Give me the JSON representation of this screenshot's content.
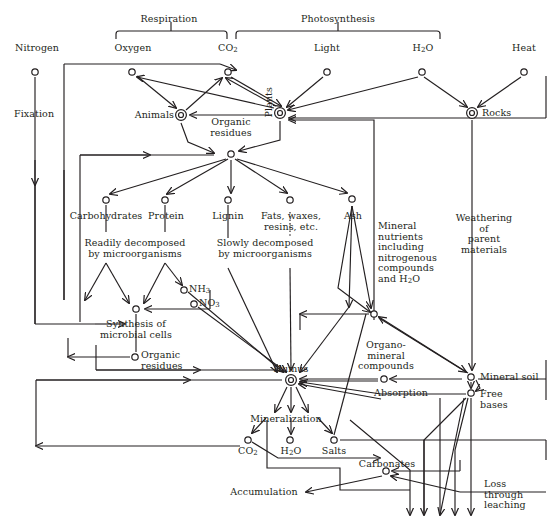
{
  "diagram": {
    "type": "flow-diagram",
    "colors": {
      "ink": "#231f20",
      "background": "#ffffff"
    },
    "brackets": [
      {
        "id": "respiration",
        "label": "Respiration"
      },
      {
        "id": "photosynthesis",
        "label": "Photosynthesis"
      }
    ],
    "labels": {
      "nitrogen": "Nitrogen",
      "oxygen": "Oxygen",
      "co2_top": "CO",
      "co2_top_sub": "2",
      "light": "Light",
      "h2o_top": "H",
      "h2o_top_sub": "2",
      "h2o_top_tail": "O",
      "heat": "Heat",
      "fixation": "Fixation",
      "animals": "Animals",
      "plants": "Plants",
      "rocks": "Rocks",
      "organic_residues_top": "Organic\nresidues",
      "carbohydrates": "Carbohydrates",
      "protein": "Protein",
      "lignin": "Lignin",
      "fats_waxes": "Fats, waxes,\nresins, etc.",
      "ash": "Ash",
      "readily_decomposed": "Readily decomposed\nby microorganisms",
      "slowly_decomposed": "Slowly decomposed\nby microorganisms",
      "mineral_nutrients": "Mineral\nnutrients\nincluding\nnitrogenous\ncompounds\nand H",
      "mineral_nutrients_sub": "2",
      "mineral_nutrients_tail": "O",
      "weathering": "Weathering of\nparent materials",
      "nh3": "NH",
      "nh3_sub": "3",
      "no3": "NO",
      "no3_sub": "3",
      "synthesis": "Synthesis of\nmicrobial cells",
      "organic_residues_mid": "Organic\nresidues",
      "humus": "Humus",
      "organo_mineral": "Organo-\nmineral\ncompounds",
      "mineral_soil": "Mineral soil",
      "absorption": "Absorption",
      "free_bases": "Free\nbases",
      "mineralization": "Mineralization",
      "co2_bottom": "CO",
      "co2_bottom_sub": "2",
      "h2o_bottom": "H",
      "h2o_bottom_sub": "2",
      "h2o_bottom_tail": "O",
      "salts": "Salts",
      "carbonates": "Carbonates",
      "accumulation": "Accumulation",
      "loss_leaching": "Loss\nthrough\nleaching"
    },
    "nodes": [
      {
        "id": "nitrogen",
        "label": "Nitrogen",
        "kind": "small-circle",
        "x": 35,
        "y": 72
      },
      {
        "id": "oxygen",
        "label": "Oxygen",
        "kind": "small-circle",
        "x": 132,
        "y": 72
      },
      {
        "id": "co2-top",
        "label": "CO2",
        "kind": "small-circle",
        "x": 228,
        "y": 72
      },
      {
        "id": "light",
        "label": "Light",
        "kind": "small-circle",
        "x": 327,
        "y": 72
      },
      {
        "id": "h2o-top",
        "label": "H2O",
        "kind": "small-circle",
        "x": 422,
        "y": 72
      },
      {
        "id": "heat",
        "label": "Heat",
        "kind": "small-circle",
        "x": 524,
        "y": 72
      },
      {
        "id": "animals",
        "label": "Animals",
        "kind": "double-circle",
        "x": 181,
        "y": 115
      },
      {
        "id": "plants",
        "label": "Plants",
        "kind": "double-circle",
        "x": 280,
        "y": 113
      },
      {
        "id": "rocks",
        "label": "Rocks",
        "kind": "double-circle",
        "x": 472,
        "y": 113
      },
      {
        "id": "organic-residues-top",
        "label": "Organic residues",
        "kind": "small-circle",
        "x": 231,
        "y": 154
      },
      {
        "id": "carbohydrates",
        "label": "Carbohydrates",
        "kind": "small-circle",
        "x": 106,
        "y": 200
      },
      {
        "id": "protein",
        "label": "Protein",
        "kind": "small-circle",
        "x": 165,
        "y": 200
      },
      {
        "id": "lignin",
        "label": "Lignin",
        "kind": "small-circle",
        "x": 228,
        "y": 200
      },
      {
        "id": "fats-waxes",
        "label": "Fats, waxes, resins, etc.",
        "kind": "small-circle",
        "x": 290,
        "y": 200
      },
      {
        "id": "ash",
        "label": "Ash",
        "kind": "small-circle",
        "x": 352,
        "y": 199
      },
      {
        "id": "nh3",
        "label": "NH3",
        "kind": "small-circle",
        "x": 184,
        "y": 290
      },
      {
        "id": "no3",
        "label": "NO3",
        "kind": "small-circle",
        "x": 194,
        "y": 304
      },
      {
        "id": "synthesis",
        "label": "Synthesis of microbial cells",
        "kind": "small-circle",
        "x": 136,
        "y": 309
      },
      {
        "id": "organic-residues-mid",
        "label": "Organic residues",
        "kind": "small-circle",
        "x": 135,
        "y": 357
      },
      {
        "id": "mineral-nutrients-junction",
        "label": "Mineral nutrients junction",
        "kind": "small-circle",
        "x": 374,
        "y": 314
      },
      {
        "id": "humus",
        "label": "Humus",
        "kind": "double-circle",
        "x": 291,
        "y": 380
      },
      {
        "id": "organo-mineral",
        "label": "Organo-mineral compounds",
        "kind": "small-circle",
        "x": 384,
        "y": 379
      },
      {
        "id": "mineral-soil",
        "label": "Mineral soil",
        "kind": "small-circle",
        "x": 471,
        "y": 377
      },
      {
        "id": "free-bases",
        "label": "Free bases",
        "kind": "small-circle",
        "x": 471,
        "y": 393
      },
      {
        "id": "co2-bottom",
        "label": "CO2",
        "kind": "small-circle",
        "x": 248,
        "y": 440
      },
      {
        "id": "h2o-bottom",
        "label": "H2O",
        "kind": "small-circle",
        "x": 290,
        "y": 440
      },
      {
        "id": "salts",
        "label": "Salts",
        "kind": "small-circle",
        "x": 334,
        "y": 440
      },
      {
        "id": "carbonates",
        "label": "Carbonates",
        "kind": "small-circle",
        "x": 386,
        "y": 471
      }
    ]
  }
}
